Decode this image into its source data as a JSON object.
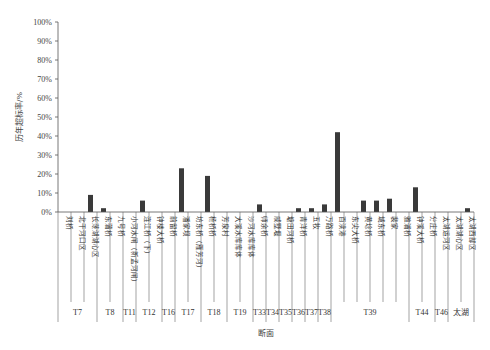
{
  "chart_data": {
    "type": "bar",
    "title": "",
    "xlabel": "断面",
    "ylabel": "历年超标率/%",
    "ylim": [
      0,
      100
    ],
    "yticks": [
      "0%",
      "10%",
      "20%",
      "30%",
      "40%",
      "50%",
      "60%",
      "70%",
      "80%",
      "90%",
      "100%"
    ],
    "grid": false,
    "legend": null,
    "bar_color": "#3a3a3a",
    "categories": [
      "刘桥",
      "北干河口区",
      "长荡湖湖心区",
      "东蒲桥",
      "九号桥",
      "小河水闸（新孟河闸）",
      "连江桥（下）",
      "钟楼大桥",
      "前留桥",
      "潘家坝",
      "坊东桥（雁芳河）",
      "杨桥桥",
      "芳泉村",
      "大溪水库库体",
      "沙河水库库体",
      "师余桥",
      "戚墅堰",
      "塘田河桥",
      "青洋桥",
      "五牧",
      "万路桥",
      "百渎港",
      "东尖大桥",
      "黄埝桥",
      "城东桥",
      "裴家",
      "雅浦桥",
      "钟溪大桥",
      "分庄桥",
      "太湖运河区",
      "太湖湖心区",
      "太湖西部区"
    ],
    "values": [
      0,
      0,
      9,
      2,
      0,
      0,
      6,
      0,
      0,
      23,
      0,
      19,
      0,
      0,
      0,
      4,
      0,
      0,
      2,
      2,
      4,
      42,
      0,
      6,
      6,
      7,
      0,
      13,
      0,
      0,
      0,
      2
    ],
    "groups": [
      {
        "label": "T7",
        "span": 3
      },
      {
        "label": "T8",
        "span": 2
      },
      {
        "label": "T11",
        "span": 1
      },
      {
        "label": "T12",
        "span": 2
      },
      {
        "label": "T16",
        "span": 1
      },
      {
        "label": "T17",
        "span": 2
      },
      {
        "label": "T18",
        "span": 2
      },
      {
        "label": "T19",
        "span": 2
      },
      {
        "label": "T33",
        "span": 1
      },
      {
        "label": "T34",
        "span": 1
      },
      {
        "label": "T35",
        "span": 1
      },
      {
        "label": "T36",
        "span": 1
      },
      {
        "label": "T37",
        "span": 1
      },
      {
        "label": "T38",
        "span": 1
      },
      {
        "label": "T39",
        "span": 6
      },
      {
        "label": "T44",
        "span": 2
      },
      {
        "label": "T46",
        "span": 1
      },
      {
        "label": "太湖",
        "span": 2
      }
    ]
  }
}
